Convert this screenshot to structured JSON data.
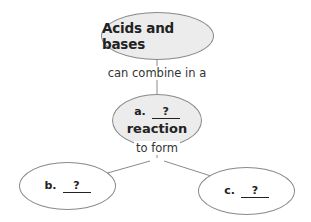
{
  "diagram": {
    "type": "concept-map",
    "nodes": {
      "top": {
        "text": "Acids and bases"
      },
      "middle": {
        "prefix": "a.",
        "blank": "?",
        "suffix": "reaction"
      },
      "left": {
        "prefix": "b.",
        "blank": "?"
      },
      "right": {
        "prefix": "c.",
        "blank": "?"
      }
    },
    "links": {
      "top_to_middle": "can combine in a",
      "middle_to_bottom": "to form"
    },
    "colors": {
      "filled_node": "#ececec",
      "border": "#8a8a8a",
      "line": "#8a8a8a"
    }
  }
}
